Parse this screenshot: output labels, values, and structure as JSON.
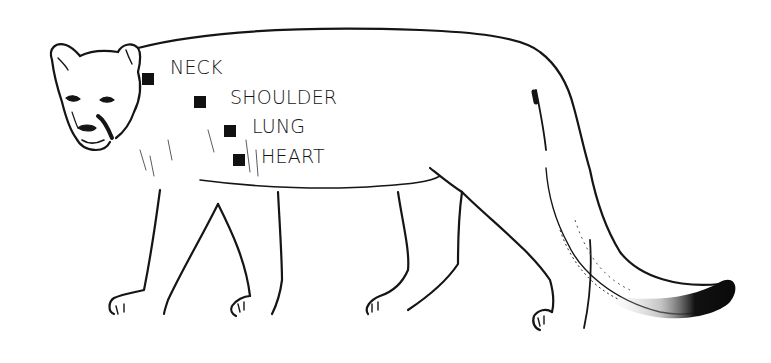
{
  "diagram": {
    "colors": {
      "ink": "#151515",
      "background": "#ffffff",
      "marker": "#111111"
    },
    "targets": [
      {
        "label": "NECK",
        "marker": {
          "x": 142,
          "y": 73
        },
        "text": {
          "x": 170,
          "y": 58
        }
      },
      {
        "label": "SHOULDER",
        "marker": {
          "x": 194,
          "y": 96
        },
        "text": {
          "x": 230,
          "y": 88
        }
      },
      {
        "label": "LUNG",
        "marker": {
          "x": 224,
          "y": 125
        },
        "text": {
          "x": 252,
          "y": 117
        }
      },
      {
        "label": "HEART",
        "marker": {
          "x": 233,
          "y": 154
        },
        "text": {
          "x": 261,
          "y": 147
        }
      }
    ]
  }
}
